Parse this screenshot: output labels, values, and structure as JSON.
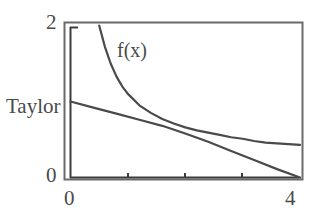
{
  "chart_data": {
    "type": "line",
    "title": "",
    "xlabel": "",
    "ylabel": "",
    "xlim": [
      0,
      4
    ],
    "ylim": [
      0,
      2
    ],
    "grid": false,
    "legend_position": "inline-annotation",
    "x_tick_labels": [
      "0",
      "4"
    ],
    "x_tick_values": [
      0,
      4
    ],
    "x_minor_tick_values": [
      1,
      2,
      3
    ],
    "y_tick_labels": [
      "0",
      "2"
    ],
    "y_tick_values": [
      0,
      2
    ],
    "series": [
      {
        "name": "f(x)",
        "color": "#4a4a4a",
        "annotation": "f(x)",
        "x": [
          0.5,
          0.6,
          0.7,
          0.8,
          0.9,
          1.0,
          1.2,
          1.4,
          1.6,
          1.8,
          2.0,
          2.2,
          2.4,
          2.6,
          2.8,
          3.0,
          3.2,
          3.4,
          3.6,
          3.8,
          4.0
        ],
        "y": [
          2.0,
          1.72,
          1.5,
          1.33,
          1.2,
          1.1,
          0.95,
          0.85,
          0.77,
          0.71,
          0.66,
          0.62,
          0.59,
          0.56,
          0.53,
          0.51,
          0.48,
          0.46,
          0.45,
          0.44,
          0.43
        ]
      },
      {
        "name": "Taylor",
        "color": "#4a4a4a",
        "annotation": "Taylor",
        "x": [
          0.0,
          0.4,
          0.8,
          1.2,
          1.6,
          2.0,
          2.4,
          2.8,
          3.2,
          3.6,
          4.0
        ],
        "y": [
          1.0,
          0.92,
          0.84,
          0.76,
          0.68,
          0.58,
          0.47,
          0.35,
          0.23,
          0.11,
          0.0
        ]
      }
    ]
  },
  "axes": {
    "y_top_label": "2",
    "y_bottom_label": "0",
    "x_left_label": "0",
    "x_right_label": "4"
  },
  "annotations": {
    "fx_label": "f(x)",
    "taylor_label": "Taylor"
  },
  "colors": {
    "curve": "#4a4a4a",
    "axis": "#3c3c3c",
    "frame": "#555555",
    "background": "#ffffff",
    "text": "#4a4a4a"
  }
}
